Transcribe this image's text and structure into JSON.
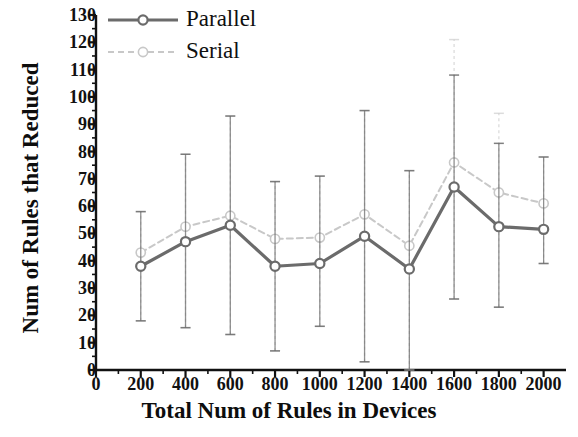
{
  "chart_data": {
    "type": "line",
    "title": "",
    "xlabel": "Total Num of Rules in Devices",
    "ylabel": "Num of Rules that Reduced",
    "x": [
      200,
      400,
      600,
      800,
      1000,
      1200,
      1400,
      1600,
      1800,
      2000
    ],
    "xlim": [
      0,
      2100
    ],
    "ylim": [
      0,
      130
    ],
    "xticks": [
      0,
      200,
      400,
      600,
      800,
      1000,
      1200,
      1400,
      1600,
      1800,
      2000
    ],
    "yticks": [
      0,
      10,
      20,
      30,
      40,
      50,
      60,
      70,
      80,
      90,
      100,
      110,
      120,
      130
    ],
    "xtick_labels": [
      "0",
      "200",
      "400",
      "600",
      "800",
      "1000",
      "1200",
      "1400",
      "1600",
      "1800",
      "2000"
    ],
    "ytick_labels": [
      "0",
      "10",
      "20",
      "30",
      "40",
      "50",
      "60",
      "70",
      "80",
      "90",
      "100",
      "110",
      "120",
      "130"
    ],
    "grid": false,
    "legend_position": "top-left",
    "error_bars": true,
    "marker": "circle-open",
    "series": [
      {
        "name": "Parallel",
        "color": "#6b6b6b",
        "linestyle": "solid",
        "values": [
          38,
          47,
          53,
          38,
          39,
          49,
          37,
          67,
          52.5,
          51.5
        ],
        "err_upper": [
          58,
          79,
          93,
          69,
          71,
          95,
          73,
          108,
          83,
          78
        ],
        "err_lower": [
          18,
          15.5,
          13,
          7,
          16,
          3,
          0,
          26,
          23,
          39
        ]
      },
      {
        "name": "Serial",
        "color": "#c8c8c8",
        "linestyle": "dashed",
        "values": [
          43,
          52.5,
          56.5,
          48,
          48.5,
          57,
          45.5,
          76,
          65,
          61
        ],
        "err_upper": [
          58,
          79,
          93,
          69,
          71,
          95,
          73,
          121,
          94,
          78
        ],
        "err_lower": [
          18,
          15.5,
          13,
          7,
          16,
          3,
          0,
          26,
          23,
          39
        ]
      }
    ]
  },
  "legend": {
    "items": [
      {
        "label": "Parallel"
      },
      {
        "label": "Serial"
      }
    ]
  }
}
